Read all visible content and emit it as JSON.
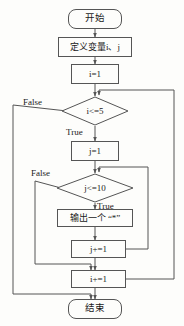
{
  "diagram": {
    "stroke_color": "#555555",
    "text_color": "#1a1a1a",
    "background_color": "#fdfdfb",
    "nodes": {
      "start": {
        "label": "开始",
        "shape": "terminator"
      },
      "declare": {
        "label": "定义变量i、j",
        "shape": "process"
      },
      "init_i": {
        "label": "i=1",
        "shape": "process"
      },
      "cond_i": {
        "label": "i<=5",
        "shape": "decision"
      },
      "init_j": {
        "label": "j=1",
        "shape": "process"
      },
      "cond_j": {
        "label": "j<=10",
        "shape": "decision"
      },
      "output": {
        "label": "输出一个 “*”",
        "shape": "process"
      },
      "inc_j": {
        "label": "j+=1",
        "shape": "process"
      },
      "inc_i": {
        "label": "i+=1",
        "shape": "process"
      },
      "end": {
        "label": "结束",
        "shape": "terminator"
      }
    },
    "edge_labels": {
      "i_false": "False",
      "i_true": "True",
      "j_false": "False",
      "j_true": "True"
    }
  }
}
